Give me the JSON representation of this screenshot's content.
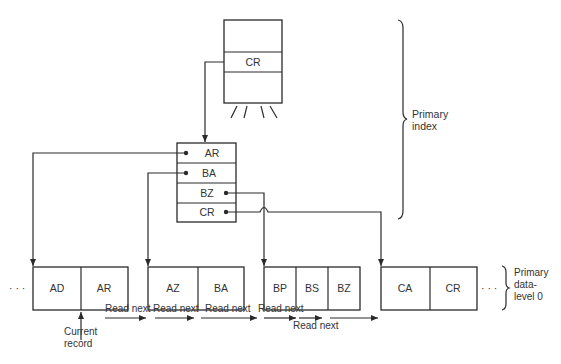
{
  "diagram": {
    "top_index_block": {
      "entry": "CR"
    },
    "index_block": {
      "entries": [
        "AR",
        "BA",
        "BZ",
        "CR"
      ]
    },
    "data_blocks": [
      {
        "records": [
          "AD",
          "AR"
        ]
      },
      {
        "records": [
          "AZ",
          "BA"
        ]
      },
      {
        "records": [
          "BP",
          "BS",
          "BZ"
        ]
      },
      {
        "records": [
          "CA",
          "CR"
        ]
      }
    ],
    "ellipsis_left": "· · ·",
    "ellipsis_right": "· · ·",
    "labels": {
      "primary_index_1": "Primary",
      "primary_index_2": "index",
      "primary_data_1": "Primary",
      "primary_data_2": "data-",
      "primary_data_3": "level 0",
      "current_record_1": "Current",
      "current_record_2": "record"
    },
    "read_next": [
      "Read next",
      "Read next",
      "Read next",
      "Read next",
      "Read next"
    ]
  }
}
